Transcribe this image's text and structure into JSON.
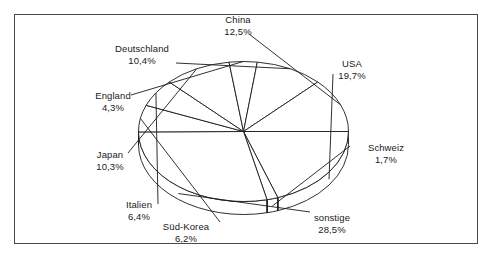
{
  "chart_data": {
    "type": "pie",
    "title": "",
    "subtitle": "",
    "xlabel": "",
    "ylabel": "",
    "legend_position": "none",
    "grid": false,
    "value_unit": "%",
    "decimal_separator": ",",
    "style": "3d-pie-outline",
    "categories": [
      "USA",
      "Schweiz",
      "sonstige",
      "Süd-Korea",
      "Italien",
      "Japan",
      "England",
      "Deutschland",
      "China"
    ],
    "values": [
      19.7,
      1.7,
      28.5,
      6.2,
      6.4,
      10.3,
      4.3,
      10.4,
      12.5
    ],
    "slices": [
      {
        "name": "USA",
        "value": 19.7,
        "label": "USA",
        "percent_text": "19,7%"
      },
      {
        "name": "Schweiz",
        "value": 1.7,
        "label": "Schweiz",
        "percent_text": "1,7%"
      },
      {
        "name": "sonstige",
        "value": 28.5,
        "label": "sonstige",
        "percent_text": "28,5%"
      },
      {
        "name": "Sued-Korea",
        "value": 6.2,
        "label": "Süd-Korea",
        "percent_text": "6,2%"
      },
      {
        "name": "Italien",
        "value": 6.4,
        "label": "Italien",
        "percent_text": "6,4%"
      },
      {
        "name": "Japan",
        "value": 10.3,
        "label": "Japan",
        "percent_text": "10,3%"
      },
      {
        "name": "England",
        "value": 4.3,
        "label": "England",
        "percent_text": "4,3%"
      },
      {
        "name": "Deutschland",
        "value": 10.4,
        "label": "Deutschland",
        "percent_text": "10,4%"
      },
      {
        "name": "China",
        "value": 12.5,
        "label": "China",
        "percent_text": "12,5%"
      }
    ],
    "colors": {
      "slice_fill": "#ffffff",
      "slice_stroke": "#1a1a1a",
      "frame_stroke": "#4a4a4a",
      "text": "#1a1a1a",
      "background": "#ffffff"
    }
  },
  "labels": {
    "china": {
      "name": "China",
      "percent": "12,5%"
    },
    "usa": {
      "name": "USA",
      "percent": "19,7%"
    },
    "schweiz": {
      "name": "Schweiz",
      "percent": "1,7%"
    },
    "sonstige": {
      "name": "sonstige",
      "percent": "28,5%"
    },
    "suedkorea": {
      "name": "Süd-Korea",
      "percent": "6,2%"
    },
    "italien": {
      "name": "Italien",
      "percent": "6,4%"
    },
    "japan": {
      "name": "Japan",
      "percent": "10,3%"
    },
    "england": {
      "name": "England",
      "percent": "4,3%"
    },
    "deutschland": {
      "name": "Deutschland",
      "percent": "10,4%"
    }
  }
}
